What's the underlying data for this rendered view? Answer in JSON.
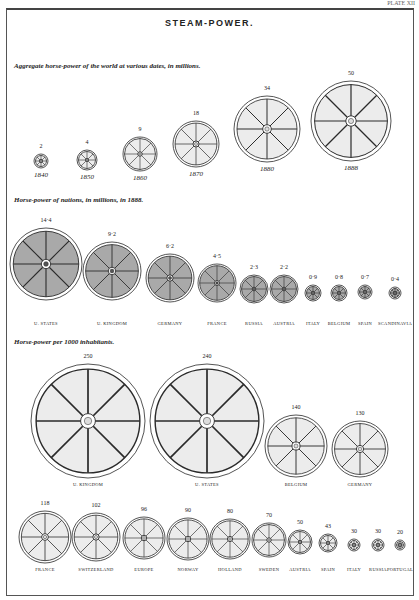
{
  "page": {
    "plate_label": "PLATE XII",
    "title": "STEAM-POWER."
  },
  "sections": {
    "world": {
      "heading": "Aggregate horse-power of the world at various dates, in millions."
    },
    "nations": {
      "heading": "Horse-power of nations, in millions, in 1888."
    },
    "per_capita": {
      "heading": "Horse-power per 1000 inhabitants."
    }
  },
  "colors": {
    "light_fill": "#ececec",
    "dark_fill": "#a9a9a9",
    "line": "#2a2a2a"
  },
  "chart_data": [
    {
      "type": "proportional-wheel",
      "title": "Aggregate horse-power of the world at various dates, in millions.",
      "categories": [
        "1840",
        "1850",
        "1860",
        "1870",
        "1880",
        "1888"
      ],
      "values": [
        2,
        4,
        9,
        18,
        34,
        50
      ],
      "value_labels": [
        "2",
        "4",
        "9",
        "18",
        "34",
        "50"
      ]
    },
    {
      "type": "proportional-wheel",
      "title": "Horse-power of nations, in millions, in 1888.",
      "categories": [
        "U. States",
        "U. Kingdom",
        "Germany",
        "France",
        "Russia",
        "Austria",
        "Italy",
        "Belgium",
        "Spain",
        "Scandinavia"
      ],
      "values": [
        14.4,
        9.2,
        6.2,
        4.5,
        2.3,
        2.2,
        0.9,
        0.8,
        0.7,
        0.4
      ],
      "value_labels": [
        "14·4",
        "9·2",
        "6·2",
        "4·5",
        "2·3",
        "2·2",
        "0·9",
        "0·8",
        "0·7",
        "0·4"
      ]
    },
    {
      "type": "proportional-wheel",
      "title": "Horse-power per 1000 inhabitants.",
      "categories": [
        "U. Kingdom",
        "U. States",
        "Belgium",
        "Germany",
        "France",
        "Switzerland",
        "Europe",
        "Norway",
        "Holland",
        "Sweden",
        "Austria",
        "Spain",
        "Italy",
        "Russia",
        "Portugal"
      ],
      "values": [
        250,
        240,
        140,
        130,
        118,
        102,
        96,
        90,
        80,
        70,
        50,
        43,
        30,
        30,
        20
      ],
      "value_labels": [
        "250",
        "240",
        "140",
        "130",
        "118",
        "102",
        "96",
        "90",
        "80",
        "70",
        "50",
        "43",
        "30",
        "30",
        "20"
      ]
    }
  ],
  "world": [
    {
      "year": "1840",
      "value": "2"
    },
    {
      "year": "1850",
      "value": "4"
    },
    {
      "year": "1860",
      "value": "9"
    },
    {
      "year": "1870",
      "value": "18"
    },
    {
      "year": "1880",
      "value": "34"
    },
    {
      "year": "1888",
      "value": "50"
    }
  ],
  "nations": [
    {
      "name": "U. STATES",
      "value": "14·4"
    },
    {
      "name": "U. KINGDOM",
      "value": "9·2"
    },
    {
      "name": "GERMANY",
      "value": "6·2"
    },
    {
      "name": "FRANCE",
      "value": "4·5"
    },
    {
      "name": "RUSSIA",
      "value": "2·3"
    },
    {
      "name": "AUSTRIA",
      "value": "2·2"
    },
    {
      "name": "ITALY",
      "value": "0·9"
    },
    {
      "name": "BELGIUM",
      "value": "0·8"
    },
    {
      "name": "SPAIN",
      "value": "0·7"
    },
    {
      "name": "SCANDINAVIA",
      "value": "0·4"
    }
  ],
  "per_capita": [
    {
      "name": "U. KINGDOM",
      "value": "250"
    },
    {
      "name": "U. STATES",
      "value": "240"
    },
    {
      "name": "BELGIUM",
      "value": "140"
    },
    {
      "name": "GERMANY",
      "value": "130"
    },
    {
      "name": "FRANCE",
      "value": "118"
    },
    {
      "name": "SWITZERLAND",
      "value": "102"
    },
    {
      "name": "EUROPE",
      "value": "96"
    },
    {
      "name": "NORWAY",
      "value": "90"
    },
    {
      "name": "HOLLAND",
      "value": "80"
    },
    {
      "name": "SWEDEN",
      "value": "70"
    },
    {
      "name": "AUSTRIA",
      "value": "50"
    },
    {
      "name": "SPAIN",
      "value": "43"
    },
    {
      "name": "ITALY",
      "value": "30"
    },
    {
      "name": "RUSSIA",
      "value": "30"
    },
    {
      "name": "PORTUGAL",
      "value": "20"
    }
  ]
}
